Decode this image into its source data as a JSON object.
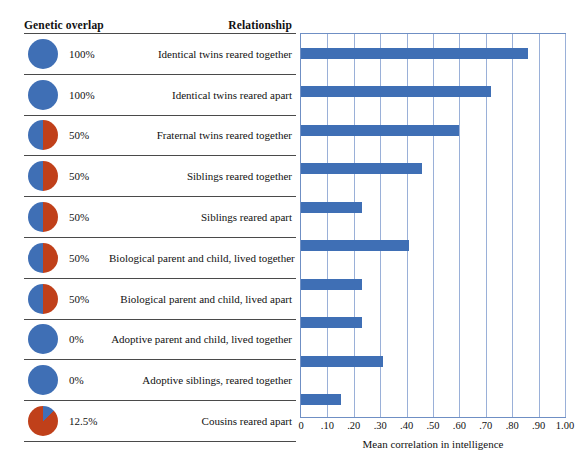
{
  "headers": {
    "genetic_overlap": "Genetic overlap",
    "relationship": "Relationship"
  },
  "axis": {
    "title": "Mean correlation in intelligence",
    "ticks": [
      "0",
      ".10",
      ".20",
      ".30",
      ".40",
      ".50",
      ".60",
      ".70",
      ".80",
      ".90",
      "1.00"
    ],
    "tick_values": [
      0,
      0.1,
      0.2,
      0.3,
      0.4,
      0.5,
      0.6,
      0.7,
      0.8,
      0.9,
      1.0
    ],
    "min": 0,
    "max": 1.0
  },
  "colors": {
    "bar": "#3f6fb5",
    "pie_blue": "#3f6fb5",
    "pie_red": "#c0401a",
    "gridline": "#9ab0d8",
    "rule": "#4a4a4a"
  },
  "rows": [
    {
      "overlap": "100%",
      "overlap_fraction": 1.0,
      "relationship": "Identical twins reared together",
      "value": 0.86
    },
    {
      "overlap": "100%",
      "overlap_fraction": 1.0,
      "relationship": "Identical twins reared apart",
      "value": 0.72
    },
    {
      "overlap": "50%",
      "overlap_fraction": 0.5,
      "relationship": "Fraternal twins reared together",
      "value": 0.6
    },
    {
      "overlap": "50%",
      "overlap_fraction": 0.5,
      "relationship": "Siblings reared together",
      "value": 0.46
    },
    {
      "overlap": "50%",
      "overlap_fraction": 0.5,
      "relationship": "Siblings reared apart",
      "value": 0.23
    },
    {
      "overlap": "50%",
      "overlap_fraction": 0.5,
      "relationship": "Biological parent and child, lived together",
      "value": 0.41
    },
    {
      "overlap": "50%",
      "overlap_fraction": 0.5,
      "relationship": "Biological parent and child, lived apart",
      "value": 0.23
    },
    {
      "overlap": "0%",
      "overlap_fraction": 0.0,
      "relationship": "Adoptive parent and child, lived together",
      "value": 0.23
    },
    {
      "overlap": "0%",
      "overlap_fraction": 0.0,
      "relationship": "Adoptive siblings, reared together",
      "value": 0.31
    },
    {
      "overlap": "12.5%",
      "overlap_fraction": 0.125,
      "relationship": "Cousins reared apart",
      "value": 0.15
    }
  ],
  "chart_data": {
    "type": "bar",
    "orientation": "horizontal",
    "title": "",
    "xlabel": "Mean correlation in intelligence",
    "ylabel": "",
    "xlim": [
      0,
      1.0
    ],
    "xticks": [
      0,
      0.1,
      0.2,
      0.3,
      0.4,
      0.5,
      0.6,
      0.7,
      0.8,
      0.9,
      1.0
    ],
    "xticklabels": [
      "0",
      ".10",
      ".20",
      ".30",
      ".40",
      ".50",
      ".60",
      ".70",
      ".80",
      ".90",
      "1.00"
    ],
    "grid": "vertical",
    "legend": "none",
    "categories": [
      "Identical twins reared together",
      "Identical twins reared apart",
      "Fraternal twins reared together",
      "Siblings reared together",
      "Siblings reared apart",
      "Biological parent and child, lived together",
      "Biological parent and child, lived apart",
      "Adoptive parent and child, lived together",
      "Adoptive siblings, reared together",
      "Cousins reared apart"
    ],
    "values": [
      0.86,
      0.72,
      0.6,
      0.46,
      0.23,
      0.41,
      0.23,
      0.23,
      0.31,
      0.15
    ],
    "genetic_overlap": [
      "100%",
      "100%",
      "50%",
      "50%",
      "50%",
      "50%",
      "50%",
      "0%",
      "0%",
      "12.5%"
    ],
    "bar_color": "#3f6fb5"
  }
}
